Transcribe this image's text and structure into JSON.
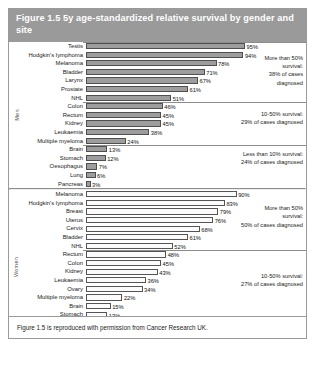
{
  "figure": {
    "title": "Figure 1.5  5y age-standardized relative survival by gender and site",
    "caption": "Figure 1.5 is reproduced with permission from Cancer Research UK.",
    "axis_title": "Five-year relative survival",
    "men_axis_label": "Men",
    "women_axis_label": "Women"
  },
  "annotations": {
    "men_high": "More than 50% survival:\n38% of cases diagnosed",
    "men_high_line1": "More than 50%",
    "men_high_line2": "survival:",
    "men_high_line3": "38% of cases",
    "men_high_line4": "diagnosed",
    "men_mid_line1": "10-50% survival:",
    "men_mid_line2": "29% of cases diagnosed",
    "men_low_line1": "Less than 10% survival:",
    "men_low_line2": "24% of cases diagnosed",
    "women_high_line1": "More than 50%",
    "women_high_line2": "survival:",
    "women_high_line3": "50% of cases diagnosed",
    "women_mid_line1": "10-50% survival:",
    "women_mid_line2": "27% of cases diagnosed",
    "women_low_line1": "less than 10% survival:",
    "women_low_line2": "15% of cases diagnosed"
  },
  "chart_data": {
    "type": "bar",
    "title": "Figure 1.5  5y age-standardized relative survival by gender and site",
    "xlabel": "Five-year relative survival",
    "ylabel": "",
    "xlim": [
      0,
      100
    ],
    "grid": false,
    "orientation": "horizontal",
    "legend": "none",
    "groups": [
      {
        "name": "Men",
        "categories": [
          "Testis",
          "Hodgkin's lymphoma",
          "Melanoma",
          "Bladder",
          "Larynx",
          "Prostate",
          "NHL",
          "Colon",
          "Rectum",
          "Kidney",
          "Leukaemia",
          "Multiple myeloma",
          "Brain",
          "Stomach",
          "Oesophagus",
          "Lung",
          "Pancreas"
        ],
        "values": [
          95,
          94,
          78,
          71,
          67,
          61,
          51,
          46,
          45,
          45,
          38,
          24,
          13,
          12,
          7,
          6,
          3
        ],
        "labels": [
          "95%",
          "94%",
          "78%",
          "71%",
          "67%",
          "61%",
          "51%",
          "46%",
          "45%",
          "45%",
          "38%",
          "24%",
          "13%",
          "12%",
          "7%",
          "6%",
          "3%"
        ],
        "bands": [
          {
            "label": "More than 50% survival",
            "share": "38% of cases diagnosed",
            "count": 7
          },
          {
            "label": "10-50% survival",
            "share": "29% of cases diagnosed",
            "count": 5
          },
          {
            "label": "Less than 10% survival",
            "share": "24% of cases diagnosed",
            "count": 5
          }
        ]
      },
      {
        "name": "Women",
        "categories": [
          "Melanoma",
          "Hodgkin's lymphoma",
          "Breast",
          "Uterus",
          "Cervix",
          "Bladder",
          "NHL",
          "Rectum",
          "Colon",
          "Kidney",
          "Leukaemia",
          "Ovary",
          "Multiple myeloma",
          "Brain",
          "Stomach",
          "Oesophagus",
          "Lung",
          "Pancreas"
        ],
        "values": [
          90,
          83,
          79,
          76,
          68,
          61,
          52,
          48,
          45,
          43,
          36,
          34,
          22,
          15,
          13,
          8,
          6,
          2
        ],
        "labels": [
          "90%",
          "83%",
          "79%",
          "76%",
          "68%",
          "61%",
          "52%",
          "48%",
          "45%",
          "43%",
          "36%",
          "34%",
          "22%",
          "15%",
          "13%",
          "8%",
          "6%",
          "2%"
        ],
        "bands": [
          {
            "label": "More than 50% survival",
            "share": "50% of cases diagnosed",
            "count": 7
          },
          {
            "label": "10-50% survival",
            "share": "27% of cases diagnosed",
            "count": 8
          },
          {
            "label": "less than 10% survival",
            "share": "15% of cases diagnosed",
            "count": 3
          }
        ]
      }
    ]
  }
}
